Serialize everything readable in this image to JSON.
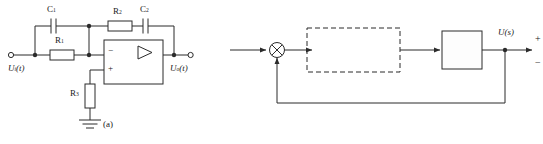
{
  "figure": {
    "panel_a": {
      "caption": "(a)",
      "type": "op-amp-circuit",
      "input_label": {
        "base": "U",
        "sub": "i",
        "arg": "(t)"
      },
      "output_label": {
        "base": "U",
        "sub": "o",
        "arg": "(t)"
      },
      "components": [
        {
          "id": "C1",
          "base": "C",
          "sub": "1",
          "kind": "capacitor",
          "orientation": "horizontal",
          "branch": "input-feedforward-top"
        },
        {
          "id": "R1",
          "base": "R",
          "sub": "1",
          "kind": "resistor",
          "orientation": "horizontal",
          "branch": "input-series"
        },
        {
          "id": "R2",
          "base": "R",
          "sub": "2",
          "kind": "resistor",
          "orientation": "horizontal",
          "branch": "feedback"
        },
        {
          "id": "C2",
          "base": "C",
          "sub": "2",
          "kind": "capacitor",
          "orientation": "horizontal",
          "branch": "feedback"
        },
        {
          "id": "R3",
          "base": "R",
          "sub": "3",
          "kind": "resistor",
          "orientation": "vertical",
          "branch": "noninverting-to-ground"
        }
      ],
      "opamp": {
        "inverting_sign": "−",
        "noninverting_sign": "+",
        "symbol": "triangle"
      },
      "ground": true
    },
    "panel_b": {
      "caption": "(b)",
      "type": "control-block-diagram",
      "input_label": {
        "base": "U",
        "sub": "",
        "arg": "(s)"
      },
      "error_label": {
        "base": "E",
        "sub": "",
        "arg": "(s)"
      },
      "control_label": {
        "base": "C",
        "sub": "",
        "arg": "(s)"
      },
      "output_label": {
        "base": "U",
        "sub": "c",
        "arg": "(s)"
      },
      "summing_junction": {
        "symbol": "circle-cross",
        "positive_sign": "+",
        "negative_sign": "−"
      },
      "pid_block": {
        "style": "dashed",
        "gain": {
          "base": "K",
          "sub": "p"
        },
        "term_proportional": "1",
        "term_integral_numerator": "1",
        "term_integral_denominator": {
          "base": "T",
          "sub": "i",
          "var": "s"
        },
        "term_derivative": {
          "base": "T",
          "sub": "d",
          "var": "s"
        },
        "plus_1": "+",
        "plus_2": "+",
        "open_paren": "(",
        "close_paren": ")"
      },
      "plant_block": {
        "style": "solid",
        "label": {
          "base": "G",
          "arg": "(s)"
        }
      },
      "feedback": {
        "type": "unity",
        "path": "output-to-summing-junction"
      }
    }
  },
  "colors": {
    "line": "#2b2b2b",
    "background": "#ffffff",
    "box_fill": "#ffffff"
  }
}
